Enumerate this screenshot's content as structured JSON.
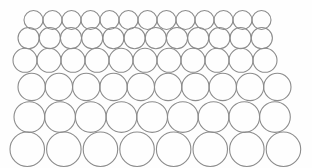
{
  "canvas": {
    "width": 312,
    "height": 168,
    "background": "#fefefe"
  },
  "pattern": {
    "description": "six rows of outlined circles, size increasing top to bottom",
    "stroke_color": "#8c8c8c",
    "stroke_width": 1.1,
    "fill": "none",
    "total_circles": 63,
    "rows": [
      {
        "count": 13,
        "diameter": 19.0,
        "x_start": 24,
        "y_top": 10.5,
        "spacing": 19.0
      },
      {
        "count": 12,
        "diameter": 21.2,
        "x_start": 18,
        "y_top": 27.5,
        "spacing": 21.2
      },
      {
        "count": 11,
        "diameter": 24.0,
        "x_start": 13,
        "y_top": 48.3,
        "spacing": 24.0
      },
      {
        "count": 10,
        "diameter": 27.3,
        "x_start": 18,
        "y_top": 73.3,
        "spacing": 27.3
      },
      {
        "count": 9,
        "diameter": 30.7,
        "x_start": 14,
        "y_top": 101.7,
        "spacing": 30.7
      },
      {
        "count": 8,
        "diameter": 34.5,
        "x_start": 10,
        "y_top": 132.0,
        "spacing": 36.6
      }
    ]
  }
}
